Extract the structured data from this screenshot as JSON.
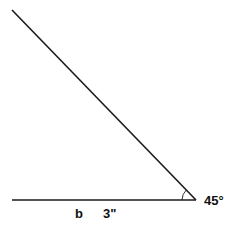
{
  "diagram": {
    "type": "angle",
    "angle_label": "45°",
    "side_label": "b",
    "side_length_label": "3\"",
    "stroke_color": "#1a1a1a",
    "vertex": [
      196,
      200
    ],
    "horizontal_ray_end": [
      12,
      200
    ],
    "slanted_ray_end": [
      12,
      10
    ]
  }
}
